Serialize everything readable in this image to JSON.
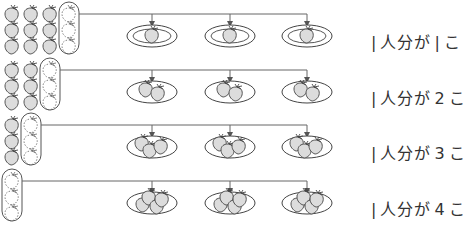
{
  "colors": {
    "line": "#555555",
    "strawberry_fill": "#dcdcdc",
    "stroke": "#444444",
    "background": "#ffffff"
  },
  "rows": [
    {
      "per_person": 1,
      "pile_count": 9,
      "group_count": 3,
      "plates": 3,
      "label_prefix": "|",
      "label_mid": "人分が",
      "label_num": "|",
      "label_suffix": "こ"
    },
    {
      "per_person": 2,
      "pile_count": 6,
      "group_count": 3,
      "plates": 3,
      "label_prefix": "|",
      "label_mid": "人分が",
      "label_num": "2",
      "label_suffix": "こ"
    },
    {
      "per_person": 3,
      "pile_count": 3,
      "group_count": 3,
      "plates": 3,
      "label_prefix": "|",
      "label_mid": "人分が",
      "label_num": "3",
      "label_suffix": "こ"
    },
    {
      "per_person": 4,
      "pile_count": 0,
      "group_count": 3,
      "plates": 3,
      "label_prefix": "|",
      "label_mid": "人分が",
      "label_num": "4",
      "label_suffix": "こ"
    }
  ]
}
